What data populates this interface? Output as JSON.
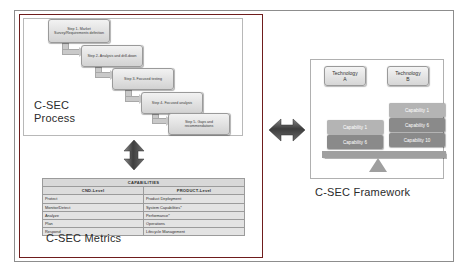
{
  "diagram": {
    "left_panel": {
      "process": {
        "caption": "C-SEC\nProcess",
        "steps": [
          {
            "label": "Step 1- Market Survey/Requirements definition"
          },
          {
            "label": "Step 2- Analysis and drill-down"
          },
          {
            "label": "Step 3- Focused testing"
          },
          {
            "label": "Step 4- Focused analysis"
          },
          {
            "label": "Step 5- Gaps and recommendations"
          }
        ]
      },
      "metrics": {
        "caption": "C-SEC Metrics",
        "table": {
          "title": "CAPABILITIES",
          "columns": [
            "CND-Level",
            "PRODUCT-Level"
          ],
          "rows": [
            {
              "cnd": "Protect",
              "product": "Product Deployment"
            },
            {
              "cnd": "Monitor/Detect",
              "product": "System Capabilities*"
            },
            {
              "cnd": "Analyze",
              "product": "Performance*"
            },
            {
              "cnd": "Plan",
              "product": "Operations"
            },
            {
              "cnd": "Respond",
              "product": "Lifecycle Management"
            }
          ]
        }
      }
    },
    "right_panel": {
      "caption": "C-SEC Framework",
      "technologies": [
        {
          "label": "Technology\nA"
        },
        {
          "label": "Technology\nB"
        }
      ],
      "capabilities_left": [
        {
          "label": "Capability 1",
          "shade": "light"
        },
        {
          "label": "Capability 6",
          "shade": "dark"
        }
      ],
      "capabilities_right": [
        {
          "label": "Capability 1",
          "shade": "light"
        },
        {
          "label": "Capability 6",
          "shade": "dark"
        },
        {
          "label": "Capability 10",
          "shade": "dark"
        }
      ]
    },
    "connectors": {
      "vertical_arrow": "double-arrow-vertical",
      "middle_arrow": "double-arrow-horizontal"
    },
    "colors": {
      "panel_border": "#6f1d1d",
      "frame_border": "#8d8d8d",
      "arrow_fill": "#4a4a4a",
      "capability_light": "#b4b4b4",
      "capability_dark": "#8a8a8a"
    }
  }
}
